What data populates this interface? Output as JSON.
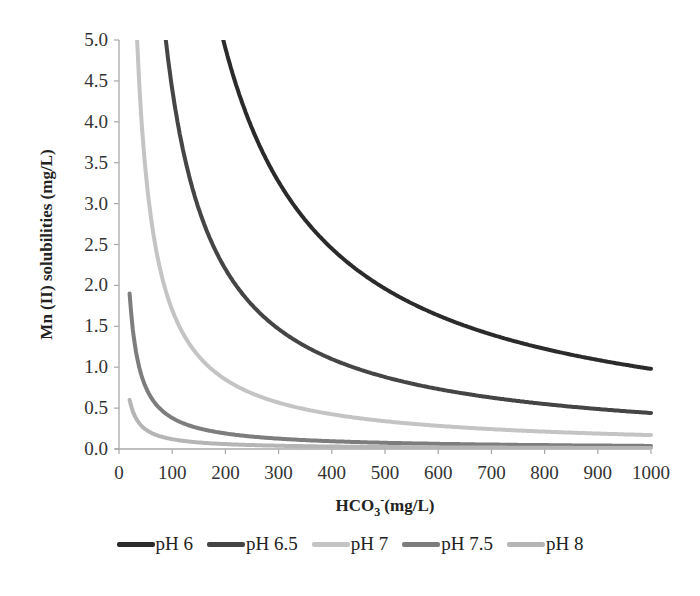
{
  "chart_data": {
    "type": "line",
    "title": "",
    "xlabel": "HCO3- (mg/L)",
    "xlabel_parts": {
      "base": "HCO",
      "sub": "3",
      "sup": "-",
      "rest": "(mg/L)"
    },
    "ylabel": "Mn (II) solubilities (mg/L)",
    "xlim": [
      0,
      1000
    ],
    "ylim": [
      0,
      5.0
    ],
    "x_ticks": [
      "0",
      "100",
      "200",
      "300",
      "400",
      "500",
      "600",
      "700",
      "800",
      "900",
      "1000"
    ],
    "y_ticks": [
      "0.0",
      "0.5",
      "1.0",
      "1.5",
      "2.0",
      "2.5",
      "3.0",
      "3.5",
      "4.0",
      "4.5",
      "5.0"
    ],
    "grid": false,
    "legend_position": "bottom",
    "x": [
      20,
      30,
      40,
      50,
      60,
      80,
      100,
      125,
      150,
      200,
      250,
      300,
      350,
      400,
      500,
      600,
      700,
      800,
      900,
      1000
    ],
    "series": [
      {
        "name": "pH 6",
        "color": "#2b2b2b",
        "values": [
          49.0,
          32.7,
          24.5,
          19.6,
          16.3,
          12.25,
          9.8,
          7.84,
          6.53,
          4.9,
          3.92,
          3.27,
          2.8,
          2.45,
          1.96,
          1.63,
          1.4,
          1.23,
          1.09,
          0.98
        ]
      },
      {
        "name": "pH 6.5",
        "color": "#454545",
        "values": [
          22.0,
          14.7,
          11.0,
          8.8,
          7.33,
          5.5,
          4.4,
          3.52,
          2.93,
          2.2,
          1.76,
          1.47,
          1.26,
          1.1,
          0.88,
          0.73,
          0.63,
          0.55,
          0.49,
          0.44
        ]
      },
      {
        "name": "pH 7",
        "color": "#c4c4c4",
        "values": [
          8.5,
          5.67,
          4.25,
          3.4,
          2.83,
          2.13,
          1.7,
          1.36,
          1.13,
          0.85,
          0.68,
          0.57,
          0.49,
          0.43,
          0.34,
          0.28,
          0.24,
          0.21,
          0.19,
          0.17
        ]
      },
      {
        "name": "pH 7.5",
        "color": "#7d7d7d",
        "values": [
          1.9,
          1.27,
          0.95,
          0.76,
          0.63,
          0.48,
          0.38,
          0.3,
          0.25,
          0.19,
          0.15,
          0.13,
          0.11,
          0.095,
          0.076,
          0.063,
          0.054,
          0.048,
          0.042,
          0.038
        ]
      },
      {
        "name": "pH 8",
        "color": "#b5b5b5",
        "values": [
          0.6,
          0.4,
          0.3,
          0.24,
          0.2,
          0.15,
          0.12,
          0.096,
          0.08,
          0.06,
          0.048,
          0.04,
          0.034,
          0.03,
          0.024,
          0.02,
          0.017,
          0.015,
          0.013,
          0.012
        ]
      }
    ]
  },
  "legend": {
    "items": [
      {
        "label": "pH 6",
        "color": "#2b2b2b"
      },
      {
        "label": "pH 6.5",
        "color": "#454545"
      },
      {
        "label": "pH 7",
        "color": "#c4c4c4"
      },
      {
        "label": "pH 7.5",
        "color": "#7d7d7d"
      },
      {
        "label": "pH 8",
        "color": "#b5b5b5"
      }
    ]
  }
}
